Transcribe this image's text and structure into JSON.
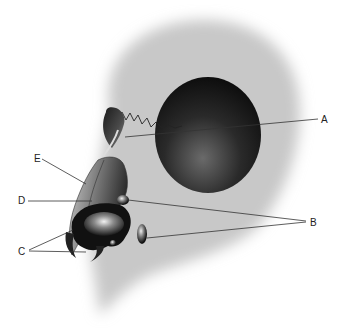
{
  "diagram": {
    "type": "anatomical-sinus-sagittal",
    "labels": [
      {
        "id": "A",
        "text": "A",
        "x": 321,
        "y": 115
      },
      {
        "id": "B",
        "text": "B",
        "x": 310,
        "y": 218
      },
      {
        "id": "C",
        "text": "C",
        "x": 18,
        "y": 247
      },
      {
        "id": "D",
        "text": "D",
        "x": 18,
        "y": 196
      },
      {
        "id": "E",
        "text": "E",
        "x": 34,
        "y": 154
      }
    ]
  }
}
